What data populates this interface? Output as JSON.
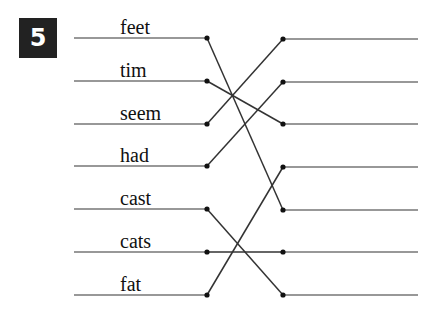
{
  "exercise": {
    "number": "5",
    "badge_color": "#222222",
    "line_color": "#333333"
  },
  "left_words": [
    {
      "label": "feet",
      "y": 38
    },
    {
      "label": "tim",
      "y": 81
    },
    {
      "label": "seem",
      "y": 124
    },
    {
      "label": "had",
      "y": 166
    },
    {
      "label": "cast",
      "y": 209
    },
    {
      "label": "cats",
      "y": 252
    },
    {
      "label": "fat",
      "y": 295
    }
  ],
  "right_rows_y": [
    39,
    82,
    124,
    167,
    210,
    252,
    295
  ],
  "connections": [
    {
      "from": "feet",
      "to_row": 5
    },
    {
      "from": "tim",
      "to_row": 3
    },
    {
      "from": "seem",
      "to_row": 1
    },
    {
      "from": "had",
      "to_row": 2
    },
    {
      "from": "cast",
      "to_row": 7
    },
    {
      "from": "cats",
      "to_row": 6
    },
    {
      "from": "fat",
      "to_row": 4
    }
  ],
  "geometry": {
    "left_line_x1": 74,
    "left_dot_x": 207,
    "right_dot_x": 283,
    "right_line_x2": 418
  }
}
